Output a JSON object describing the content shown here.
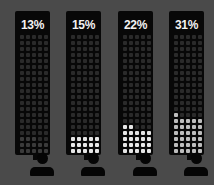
{
  "chart_data": {
    "type": "pictogram",
    "title": "",
    "categories": [
      "Person 1",
      "Person 2",
      "Person 3",
      "Person 4"
    ],
    "values": [
      13,
      15,
      22,
      31
    ],
    "labels": [
      "13%",
      "15%",
      "22%",
      "31%"
    ],
    "grid": {
      "rows": 20,
      "cols": 5,
      "total": 100
    },
    "unit": "%"
  },
  "columns": [
    {
      "label": "13%",
      "value": 13,
      "left": 15,
      "style": "mid"
    },
    {
      "label": "15%",
      "value": 15,
      "left": 66,
      "style": "on"
    },
    {
      "label": "22%",
      "value": 22,
      "left": 118,
      "style": "on"
    },
    {
      "label": "31%",
      "value": 31,
      "left": 169,
      "style": "mid"
    }
  ],
  "colors": {
    "background": "#4a4a4a",
    "panel": "#080808",
    "dot_off": "#2a2a2a",
    "dot_on": "#e6e6e6"
  }
}
